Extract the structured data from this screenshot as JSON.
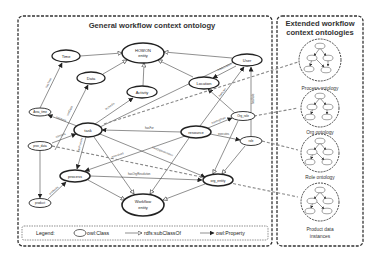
{
  "general_box": {
    "title": "General workflow context ontology",
    "nodes": [
      {
        "id": "time",
        "label": "Time"
      },
      {
        "id": "howon",
        "label": "HOWON",
        "label2": "entity"
      },
      {
        "id": "data",
        "label": "Data"
      },
      {
        "id": "activity",
        "label": "Activity"
      },
      {
        "id": "location",
        "label": "Location"
      },
      {
        "id": "user",
        "label": "User"
      },
      {
        "id": "area_time",
        "label": "Area_time"
      },
      {
        "id": "task",
        "label": "task"
      },
      {
        "id": "resource",
        "label": "resource"
      },
      {
        "id": "org_role",
        "label": "Org_role"
      },
      {
        "id": "role",
        "label": "role"
      },
      {
        "id": "proc_data",
        "label": "proc_data"
      },
      {
        "id": "process",
        "label": "process"
      },
      {
        "id": "product",
        "label": "product"
      },
      {
        "id": "workflow",
        "label": "Workflow",
        "label2": "entity"
      },
      {
        "id": "org_entity",
        "label": "org_entity"
      }
    ],
    "edge_labels": {
      "hasTime": "hasTime",
      "useData": "useData",
      "isUsedIn": "isUsedIn",
      "hasFor": "hasFor",
      "hasLocation": "hasLocation",
      "hasUser": "hasUser",
      "hasRole": "hasRole",
      "hasOrgRole": "hasOrgRole",
      "executes": "executes",
      "hasOrgResolution": "hasOrgResolution",
      "hasProcess": "hasProcess",
      "produces": "produces",
      "isInvolved": "isInvolved",
      "performs": "performs",
      "hasArea": "hasArea",
      "contains": "contains"
    }
  },
  "extended_box": {
    "title_line1": "Extended workflow",
    "title_line2": "context ontologies",
    "ontologies": [
      {
        "label": "Process ontology"
      },
      {
        "label": "Org ontology"
      },
      {
        "label": "Role ontology"
      },
      {
        "label": "Product data",
        "label2": "instances"
      }
    ]
  },
  "legend": {
    "title": "Legend:",
    "class": "owl:Class",
    "subclass": "rdfs:subClassOf",
    "property": "owl:Property"
  }
}
